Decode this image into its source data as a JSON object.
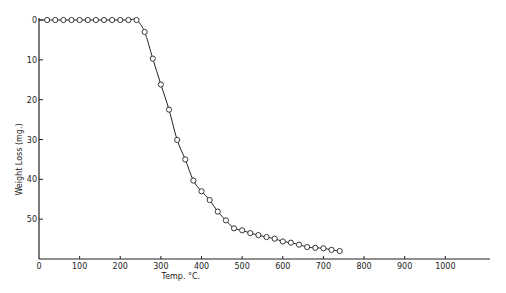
{
  "chart_data": {
    "type": "line",
    "title": "",
    "xlabel": "Temp. °C.",
    "ylabel": "Weight Loss (mg.)",
    "xlim": [
      0,
      1110
    ],
    "ylim": [
      0,
      60
    ],
    "y_inverted": true,
    "grid": false,
    "legend": "none",
    "x_ticks": [
      0,
      100,
      200,
      300,
      400,
      500,
      600,
      700,
      800,
      900,
      1000
    ],
    "x_tick_labels": [
      "0",
      "100",
      "200",
      "300",
      "400",
      "500",
      "600",
      "700",
      "800",
      "900",
      "1000"
    ],
    "y_ticks": [
      0,
      10,
      20,
      30,
      40,
      50
    ],
    "y_tick_labels": [
      "0",
      "10",
      "20",
      "30",
      "40",
      "50"
    ],
    "series": [
      {
        "name": "Weight Loss",
        "marker": "open-circle",
        "x": [
          20,
          40,
          60,
          80,
          100,
          120,
          140,
          160,
          180,
          200,
          220,
          240,
          260,
          280,
          300,
          320,
          340,
          360,
          380,
          400,
          420,
          440,
          460,
          480,
          500,
          520,
          540,
          560,
          580,
          600,
          620,
          640,
          660,
          680,
          700,
          720,
          740
        ],
        "values": [
          0,
          0,
          0,
          0,
          0,
          0,
          0,
          0,
          0,
          0,
          0,
          0,
          3.0,
          9.7,
          16.2,
          22.5,
          30.1,
          35.0,
          40.3,
          43.0,
          45.2,
          48.1,
          50.3,
          52.3,
          52.8,
          53.5,
          54.0,
          54.5,
          54.9,
          55.6,
          55.9,
          56.4,
          57.0,
          57.2,
          57.3,
          57.7,
          58.0
        ]
      }
    ]
  }
}
